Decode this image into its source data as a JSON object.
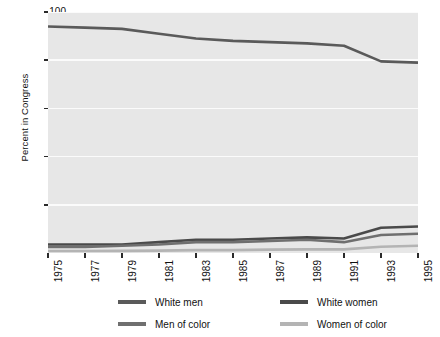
{
  "chart_data": {
    "type": "line",
    "title": "",
    "xlabel": "",
    "ylabel": "Percent in Congress",
    "xlim": [
      1975,
      1995
    ],
    "ylim": [
      0,
      100
    ],
    "grid": true,
    "legend_position": "bottom",
    "x": [
      1975,
      1977,
      1979,
      1981,
      1983,
      1985,
      1987,
      1989,
      1991,
      1993,
      1995
    ],
    "categories": [
      "1975",
      "1977",
      "1979",
      "1981",
      "1983",
      "1985",
      "1987",
      "1989",
      "1991",
      "1993",
      "1995"
    ],
    "ytick_labels": [
      "20",
      "40",
      "60",
      "80",
      "100"
    ],
    "ytick_values": [
      20,
      40,
      60,
      80,
      100
    ],
    "series": [
      {
        "name": "White men",
        "color": "#5a5a5a",
        "values": [
          94,
          93.5,
          93,
          91,
          89,
          88,
          87.5,
          87,
          86,
          79.5,
          79
        ]
      },
      {
        "name": "White women",
        "color": "#4a4a4a",
        "values": [
          3.5,
          3.5,
          3.5,
          4.5,
          5.5,
          5.5,
          6,
          6.5,
          6,
          10.5,
          11
        ]
      },
      {
        "name": "Men of color",
        "color": "#6f6f6f",
        "values": [
          2.5,
          2.5,
          3,
          3.5,
          4.5,
          4.5,
          5,
          5.5,
          4.5,
          7.5,
          8
        ]
      },
      {
        "name": "Women of color",
        "color": "#b4b4b4",
        "values": [
          0.8,
          0.8,
          0.9,
          1,
          1.2,
          1.2,
          1.4,
          1.5,
          1.5,
          2.6,
          3
        ]
      }
    ]
  },
  "legend": {
    "items": [
      {
        "label": "White men",
        "color": "#5a5a5a"
      },
      {
        "label": "White women",
        "color": "#4a4a4a"
      },
      {
        "label": "Men of color",
        "color": "#6f6f6f"
      },
      {
        "label": "Women of color",
        "color": "#b4b4b4"
      }
    ]
  },
  "axes": {
    "y_title": "Percent in Congress"
  },
  "colors": {
    "plot_background": "#e7e7e7",
    "gridline": "#fbfbfb",
    "page_background": "#ffffff",
    "text": "#111111",
    "tick": "#2a2a2a"
  }
}
